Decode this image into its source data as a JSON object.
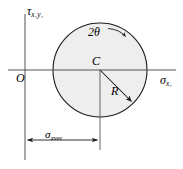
{
  "diagram": {
    "type": "mohrs-circle",
    "axes": {
      "vertical_axis_label": "τ",
      "vertical_axis_subscript": "x₁y₁",
      "horizontal_axis_label": "σ",
      "horizontal_axis_subscript": "x₁",
      "origin_label": "O",
      "origin_px": {
        "x": 25,
        "y": 70
      }
    },
    "circle": {
      "center_label": "C",
      "center_px": {
        "x": 100,
        "y": 70
      },
      "radius_px": 47,
      "fill_color": "#eeeeee",
      "stroke_color": "#1a1a1a",
      "stroke_width": 1.1
    },
    "annotations": {
      "angle_label": "2θ",
      "angle_arrow_direction": "clockwise",
      "radius_label": "R",
      "radius_arrow_from_px": {
        "x": 100,
        "y": 70
      },
      "radius_arrow_to_px": {
        "x": 133,
        "y": 103
      },
      "dimension_label": "σ",
      "dimension_subscript": "aver",
      "dimension_line_y_px": 140,
      "dimension_from_x_px": 25,
      "dimension_to_x_px": 100
    },
    "colors": {
      "ink": "#1a1a1a",
      "axis": "#4d4d4d",
      "circle_fill": "#eeeeee",
      "background": "#ffffff"
    }
  }
}
